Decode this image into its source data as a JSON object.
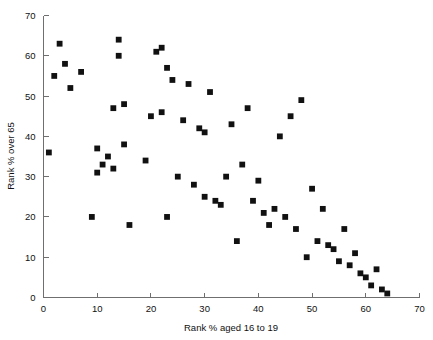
{
  "chart_data": {
    "type": "scatter",
    "title": "",
    "xlabel": "Rank % aged 16 to 19",
    "ylabel": "Rank % over 65",
    "xlim": [
      0,
      70
    ],
    "ylim": [
      0,
      70
    ],
    "xticks": [
      0,
      10,
      20,
      30,
      40,
      50,
      60,
      70
    ],
    "yticks": [
      0,
      10,
      20,
      30,
      40,
      50,
      60,
      70
    ],
    "grid": false,
    "legend": null,
    "marker": {
      "shape": "square",
      "color": "#111111",
      "size": 3.4
    },
    "series": [
      {
        "name": "districts",
        "points": [
          [
            1,
            36
          ],
          [
            2,
            55
          ],
          [
            3,
            63
          ],
          [
            4,
            58
          ],
          [
            5,
            52
          ],
          [
            7,
            56
          ],
          [
            9,
            20
          ],
          [
            10,
            37
          ],
          [
            10,
            31
          ],
          [
            11,
            33
          ],
          [
            12,
            35
          ],
          [
            13,
            32
          ],
          [
            13,
            47
          ],
          [
            14,
            60
          ],
          [
            14,
            64
          ],
          [
            15,
            48
          ],
          [
            15,
            38
          ],
          [
            16,
            18
          ],
          [
            19,
            34
          ],
          [
            20,
            45
          ],
          [
            21,
            61
          ],
          [
            22,
            62
          ],
          [
            22,
            46
          ],
          [
            23,
            57
          ],
          [
            23,
            20
          ],
          [
            24,
            54
          ],
          [
            25,
            30
          ],
          [
            26,
            44
          ],
          [
            27,
            53
          ],
          [
            28,
            28
          ],
          [
            29,
            42
          ],
          [
            30,
            41
          ],
          [
            30,
            25
          ],
          [
            31,
            51
          ],
          [
            32,
            24
          ],
          [
            33,
            23
          ],
          [
            34,
            30
          ],
          [
            35,
            43
          ],
          [
            36,
            14
          ],
          [
            37,
            33
          ],
          [
            38,
            47
          ],
          [
            39,
            24
          ],
          [
            40,
            29
          ],
          [
            41,
            21
          ],
          [
            42,
            18
          ],
          [
            43,
            22
          ],
          [
            44,
            40
          ],
          [
            45,
            20
          ],
          [
            46,
            45
          ],
          [
            47,
            17
          ],
          [
            48,
            49
          ],
          [
            49,
            10
          ],
          [
            50,
            27
          ],
          [
            51,
            14
          ],
          [
            52,
            22
          ],
          [
            53,
            13
          ],
          [
            54,
            12
          ],
          [
            55,
            9
          ],
          [
            56,
            17
          ],
          [
            57,
            8
          ],
          [
            58,
            11
          ],
          [
            59,
            6
          ],
          [
            60,
            5
          ],
          [
            61,
            3
          ],
          [
            62,
            7
          ],
          [
            63,
            2
          ],
          [
            64,
            1
          ]
        ]
      }
    ]
  },
  "axes": {
    "x_axis_name": "x-axis",
    "y_axis_name": "y-axis"
  }
}
